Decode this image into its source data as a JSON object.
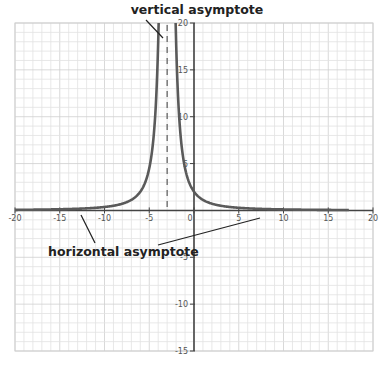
{
  "chart_data": {
    "type": "line",
    "title": "",
    "xlabel": "",
    "ylabel": "",
    "xlim": [
      -20,
      20
    ],
    "ylim": [
      -15,
      20
    ],
    "grid": true,
    "grid_minor_step": 1,
    "x_ticks": [
      -20,
      -15,
      -10,
      -5,
      0,
      5,
      10,
      15,
      20
    ],
    "y_ticks": [
      -15,
      -10,
      -5,
      5,
      10,
      15,
      20
    ],
    "x_tick_labels": [
      "-20",
      "-15",
      "-10",
      "-5",
      "0",
      "5",
      "10",
      "15",
      "20"
    ],
    "y_tick_labels": [
      "-15",
      "-10",
      "-5",
      "5",
      "10",
      "15",
      "20"
    ],
    "series": [
      {
        "name": "y = 18/(x+3)^2",
        "formula_k": 18,
        "formula_h": -3,
        "x_range": [
          -20,
          17.3
        ],
        "color": "#5a5a5a",
        "sample_points": [
          [
            -20,
            0.06
          ],
          [
            -15,
            0.13
          ],
          [
            -10,
            0.37
          ],
          [
            -6,
            2.0
          ],
          [
            -5,
            4.5
          ],
          [
            -4,
            18
          ],
          [
            -2,
            18
          ],
          [
            -1,
            4.5
          ],
          [
            0,
            2.0
          ],
          [
            2,
            0.72
          ],
          [
            5,
            0.28
          ],
          [
            10,
            0.11
          ],
          [
            17.3,
            0.04
          ]
        ]
      }
    ],
    "asymptotes": {
      "vertical": {
        "x": -3,
        "style": "dashed"
      },
      "horizontal": {
        "y": 0
      }
    },
    "annotations": [
      {
        "text": "vertical asymptote",
        "target": "x = -3"
      },
      {
        "text": "horizontal asymptote",
        "target": "y = 0"
      }
    ]
  },
  "labels": {
    "vertical": "vertical asymptote",
    "horizontal": "horizontal asymptote"
  },
  "colors": {
    "curve": "#5a5a5a",
    "axis": "#444444",
    "grid_minor": "#e2e2e2",
    "grid_major": "#cfcfcf"
  }
}
